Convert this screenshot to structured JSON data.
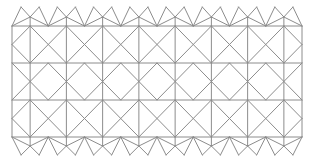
{
  "diagram": {
    "type": "geometric-tessellation-pattern",
    "stroke_color": "#8c8c8c",
    "stroke_width": 1,
    "background": "#ffffff",
    "frame": {
      "left": 12,
      "right": 302,
      "rows_y": [
        26,
        63,
        100,
        137
      ]
    },
    "column_width": 36.25,
    "columns": 8,
    "top_strip": {
      "peak_y": 7,
      "mid_vertex_y": 17
    },
    "bottom_strip": {
      "peak_y": 155,
      "mid_vertex_y": 146
    },
    "row_offsets": [
      0,
      0.5,
      0
    ]
  },
  "captions": {
    "left": "",
    "right": ""
  }
}
